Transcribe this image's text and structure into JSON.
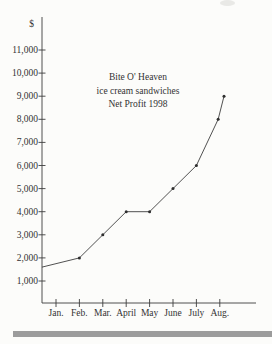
{
  "page": {
    "background": "#fcfcfa",
    "footer_bar_color": "#9c9c9c"
  },
  "chart": {
    "currency_label": "$",
    "title_lines": [
      "Bite O' Heaven",
      "ice cream sandwiches",
      "Net Profit 1998"
    ]
  },
  "chart_data": {
    "type": "line",
    "title": "Bite O' Heaven ice cream sandwiches Net Profit 1998",
    "ylabel": "$",
    "xlabel": "",
    "categories": [
      "Jan.",
      "Feb.",
      "Mar.",
      "April",
      "May",
      "June",
      "July",
      "Aug."
    ],
    "values": [
      1600,
      2000,
      3000,
      4000,
      4000,
      5000,
      6000,
      9000
    ],
    "y_ticks": [
      {
        "value": 1000,
        "label": "1,000"
      },
      {
        "value": 2000,
        "label": "2,000"
      },
      {
        "value": 3000,
        "label": "3,000"
      },
      {
        "value": 4000,
        "label": "4,000"
      },
      {
        "value": 5000,
        "label": "5,000"
      },
      {
        "value": 6000,
        "label": "6,000"
      },
      {
        "value": 7000,
        "label": "7,000"
      },
      {
        "value": 8000,
        "label": "8,000"
      },
      {
        "value": 9000,
        "label": "9,000"
      },
      {
        "value": 10000,
        "label": "10,000"
      },
      {
        "value": 11000,
        "label": "11,000"
      }
    ],
    "ylim": [
      0,
      11800
    ],
    "grid": false,
    "legend": false,
    "line_color": "#3d3d3d",
    "marker": "dot",
    "marker_color": "#2e2e2e",
    "drawn_vertices": [
      {
        "x_month": -0.6,
        "value": 1600,
        "marker": false
      },
      {
        "x_month": 1.0,
        "value": 2000,
        "marker": true
      },
      {
        "x_month": 2.0,
        "value": 3000,
        "marker": true
      },
      {
        "x_month": 3.0,
        "value": 4000,
        "marker": true
      },
      {
        "x_month": 4.0,
        "value": 4000,
        "marker": true
      },
      {
        "x_month": 5.0,
        "value": 5000,
        "marker": true
      },
      {
        "x_month": 6.0,
        "value": 6000,
        "marker": true
      },
      {
        "x_month": 6.93,
        "value": 8000,
        "marker": true
      },
      {
        "x_month": 7.18,
        "value": 9000,
        "marker": true
      }
    ]
  }
}
